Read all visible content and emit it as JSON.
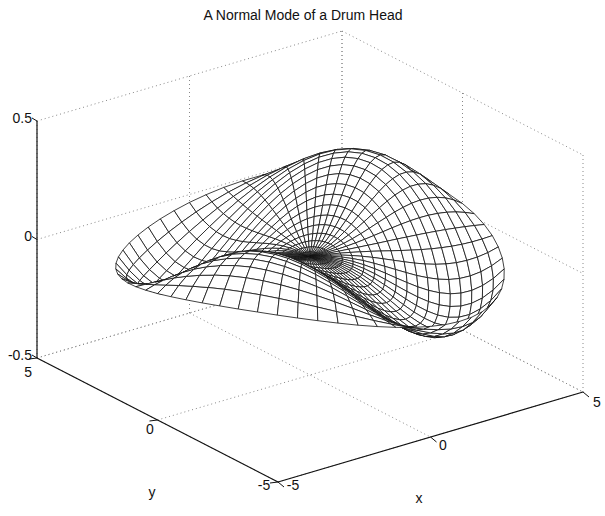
{
  "chart_data": {
    "type": "surface3d",
    "title": "A Normal Mode of a Drum Head",
    "xlabel": "x",
    "ylabel": "y",
    "zlabel": "",
    "xlim": [
      -5,
      5
    ],
    "ylim": [
      -5,
      5
    ],
    "zlim": [
      -0.5,
      0.5
    ],
    "xticks": [
      "-5",
      "0",
      "5"
    ],
    "yticks": [
      "-5",
      "0",
      "5"
    ],
    "zticks": [
      "-0.5",
      "0",
      "0.5"
    ],
    "grid": true,
    "mesh": "polar wireframe",
    "surface": {
      "radius": 5,
      "amplitude": 0.45,
      "angular_order": 2,
      "radial_lines": 60,
      "circles": 18
    }
  },
  "colors": {
    "line": "#111111",
    "grid": "#888888",
    "background": "#ffffff"
  }
}
